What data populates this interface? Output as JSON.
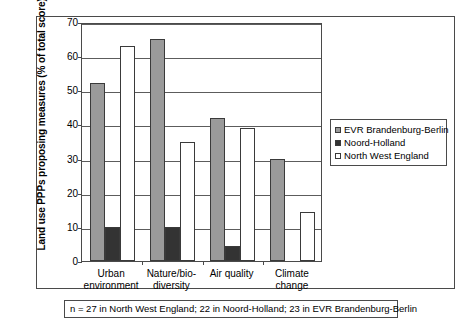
{
  "chart_data": {
    "type": "bar",
    "title": "",
    "xlabel": "",
    "ylabel": "Land use PPPs proposing measures (% of total score)",
    "ylim": [
      0,
      70
    ],
    "ytick_step": 10,
    "yticks": [
      0,
      10,
      20,
      30,
      40,
      50,
      60,
      70
    ],
    "ytick_labels": [
      "0",
      "10",
      "20",
      "30",
      "40",
      "50",
      "60",
      "70"
    ],
    "grid": true,
    "grid_axis": "y",
    "legend_position": "right",
    "categories": [
      "Urban\nenvironment",
      "Nature/bio-\ndiversity",
      "Air quality",
      "Climate\nchange"
    ],
    "series": [
      {
        "name": "EVR Brandenburg-Berlin",
        "color": "#9a9a9a",
        "values": [
          52,
          65,
          42,
          30
        ]
      },
      {
        "name": "Noord-Holland",
        "color": "#333333",
        "values": [
          10,
          10,
          4.5,
          0
        ]
      },
      {
        "name": "North West England",
        "color": "#ffffff",
        "values": [
          63,
          35,
          39,
          14.5
        ]
      }
    ],
    "annotation": "n = 27 in North West England; 22 in Noord-Holland; 23 in EVR Brandenburg-Berlin"
  },
  "legend": {
    "items": [
      {
        "label": "EVR Brandenburg-Berlin"
      },
      {
        "label": "Noord-Holland"
      },
      {
        "label": "North West England"
      }
    ]
  },
  "footnote": {
    "text": "n = 27 in North West England; 22 in Noord-Holland; 23 in EVR Brandenburg-Berlin"
  }
}
